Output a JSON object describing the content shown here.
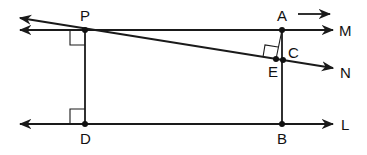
{
  "diagram": {
    "type": "geometry",
    "stroke_color": "#1a1a1a",
    "background": "#ffffff",
    "points": {
      "P": {
        "label": "P",
        "x": 85,
        "y": 30
      },
      "A": {
        "label": "A",
        "x": 282,
        "y": 30
      },
      "C": {
        "label": "C",
        "x": 282,
        "y": 60
      },
      "E": {
        "label": "E",
        "x": 276,
        "y": 59
      },
      "D": {
        "label": "D",
        "x": 85,
        "y": 124
      },
      "B": {
        "label": "B",
        "x": 282,
        "y": 124
      }
    },
    "lines": {
      "M": {
        "label": "M",
        "description": "horizontal line through P and A, arrows both ends"
      },
      "N": {
        "label": "N",
        "description": "slanted line through P, E and C, arrows both ends"
      },
      "L": {
        "label": "L",
        "description": "horizontal line through D and B, arrows both ends"
      }
    },
    "segments": [
      "PD",
      "AB",
      "AE"
    ],
    "right_angles": [
      "at P (between PD and line M)",
      "at D (between DP and line L)",
      "at E (between AE and line N)"
    ],
    "direction_arrow": {
      "description": "small arrow above A pointing right"
    }
  }
}
